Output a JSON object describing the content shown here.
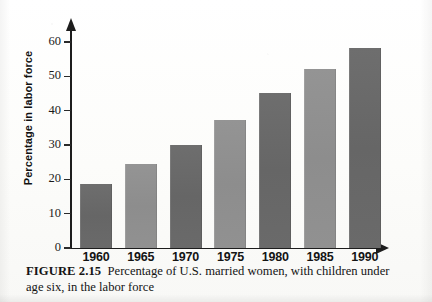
{
  "figure": {
    "label": "FIGURE 2.15",
    "caption": "Percentage of U.S. married women, with children under age six, in the labor force"
  },
  "chart_data": {
    "type": "bar",
    "title": "",
    "subtitle": "",
    "categories": [
      "1960",
      "1965",
      "1970",
      "1975",
      "1980",
      "1985",
      "1990"
    ],
    "values": [
      18.5,
      24.5,
      30.0,
      37.3,
      45.2,
      52.2,
      58.3
    ],
    "series": [
      {
        "name": "Percentage in labor force",
        "values": [
          18.5,
          24.5,
          30.0,
          37.3,
          45.2,
          52.2,
          58.3
        ]
      }
    ],
    "xlabel": "",
    "ylabel": "Percentage in labor force",
    "ylim": [
      0,
      65
    ],
    "ytick_values": [
      0,
      10,
      20,
      30,
      40,
      50,
      60
    ],
    "ytick_labels": [
      "0",
      "10",
      "20",
      "30",
      "40",
      "50",
      "60"
    ],
    "xtick_labels": [
      "1960",
      "1965",
      "1970",
      "1975",
      "1980",
      "1985",
      "1990"
    ],
    "grid": false,
    "legend": "none",
    "bar_colors": [
      "#6a6a6a",
      "#919191",
      "#6a6a6a",
      "#919191",
      "#6a6a6a",
      "#919191",
      "#6a6a6a"
    ],
    "axis_color": "#1d1d1d",
    "axis_arrows": [
      "y-up",
      "x-right"
    ]
  }
}
